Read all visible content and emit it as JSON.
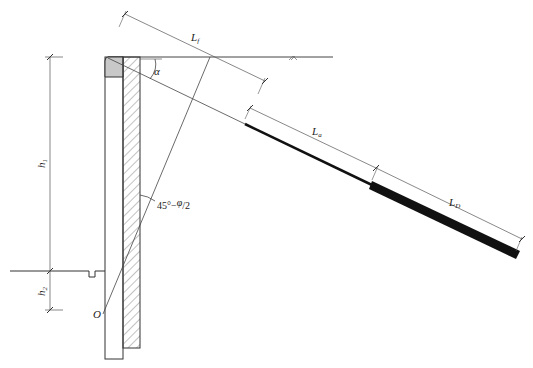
{
  "diagram": {
    "type": "anchored retaining wall cross-section",
    "labels": {
      "free_length": "L",
      "free_length_sub": "f",
      "anchor_length_a": "L",
      "anchor_length_a_sub": "a",
      "bond_length": "L",
      "bond_length_sub": "D",
      "angle_alpha": "α",
      "height_h1": "h",
      "height_h1_sub": "1",
      "height_h2": "h",
      "height_h2_sub": "2",
      "failure_angle_prefix": "45°−",
      "failure_angle_phi": "φ",
      "failure_angle_slash": "/",
      "failure_angle_den": "2",
      "point_o": "O"
    },
    "colors": {
      "line": "#333333",
      "thin_line": "#555555",
      "cap_fill": "#c8c8c8",
      "anchor_bar": "#111111",
      "background": "#ffffff"
    }
  }
}
